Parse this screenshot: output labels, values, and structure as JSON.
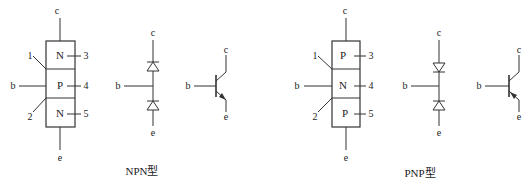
{
  "npn": {
    "caption": "NPN型",
    "layers": [
      "N",
      "P",
      "N"
    ],
    "terminals": {
      "collector": "c",
      "base": "b",
      "emitter": "e"
    },
    "callouts": [
      "1",
      "2",
      "3",
      "4",
      "5"
    ]
  },
  "pnp": {
    "caption": "PNP型",
    "layers": [
      "P",
      "N",
      "P"
    ],
    "terminals": {
      "collector": "c",
      "base": "b",
      "emitter": "e"
    },
    "callouts": [
      "1",
      "2",
      "3",
      "4",
      "5"
    ]
  }
}
